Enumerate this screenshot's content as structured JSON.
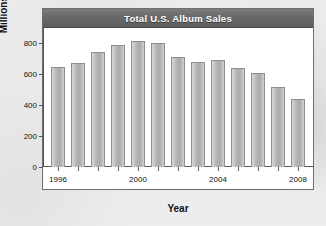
{
  "figure": {
    "title": "Total U.S. Album Sales",
    "title_band_color": "#6a6a6a",
    "title_text_color": "#ffffff",
    "frame_border_color": "#6e6e6e",
    "plot_background": "#ffffff",
    "page_background": "#ececed"
  },
  "axis_titles": {
    "y": "Millions sold",
    "x": "Year"
  },
  "chart_data": {
    "type": "bar",
    "title": "Total U.S. Album Sales",
    "xlabel": "Year",
    "ylabel": "Millions sold",
    "categories": [
      "1996",
      "1997",
      "1998",
      "1999",
      "2000",
      "2001",
      "2002",
      "2003",
      "2004",
      "2005",
      "2006",
      "2007",
      "2008"
    ],
    "values": [
      645,
      675,
      745,
      790,
      815,
      800,
      710,
      680,
      695,
      640,
      610,
      520,
      440
    ],
    "ylim": [
      0,
      900
    ],
    "yticks": [
      0,
      200,
      400,
      600,
      800
    ],
    "ytick_labels": [
      "0",
      "200",
      "400",
      "600",
      "800"
    ],
    "xticks_labeled": [
      "1996",
      "2000",
      "2004",
      "2008"
    ],
    "grid": false,
    "legend": false,
    "bar_fill_color": "#b3b3b3",
    "bar_edge_color": "#8f8f8f"
  }
}
